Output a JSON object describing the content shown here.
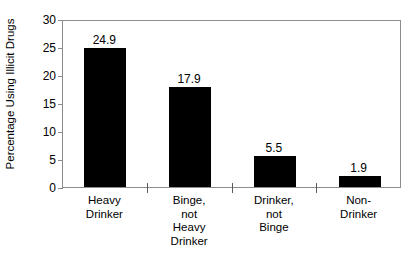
{
  "chart_data": {
    "type": "bar",
    "title": "",
    "xlabel": "",
    "ylabel": "Percentage Using Illicit Drugs",
    "categories": [
      "Heavy\nDrinker",
      "Binge,\nnot\nHeavy\nDrinker",
      "Drinker,\nnot\nBinge",
      "Non-\nDrinker"
    ],
    "values": [
      24.9,
      17.9,
      5.5,
      1.9
    ],
    "value_labels": [
      "24.9",
      "17.9",
      "5.5",
      "1.9"
    ],
    "ylim": [
      0,
      30
    ],
    "ytick_labels": [
      "0",
      "5",
      "10",
      "15",
      "20",
      "25",
      "30"
    ],
    "ytick_values": [
      0,
      5,
      10,
      15,
      20,
      25,
      30
    ],
    "grid": false,
    "legend": false,
    "bar_color": "#000000",
    "axis_color": "#8c8c8c",
    "background": "#ffffff"
  },
  "caption": {
    "remnant": " "
  }
}
